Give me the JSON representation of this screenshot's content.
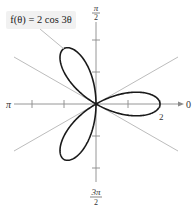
{
  "chart_data": {
    "type": "line",
    "subtype": "polar-rose",
    "title": "",
    "equation": "f(θ) = 2 cos 3θ",
    "function": {
      "amplitude": 2,
      "frequency": 3,
      "form": "cos"
    },
    "series": [
      {
        "name": "f(θ) = 2 cos 3θ",
        "petals": 3,
        "petal_angles_deg": [
          0,
          120,
          240
        ],
        "max_r": 2,
        "color": "#1a1a1a"
      }
    ],
    "axes": {
      "angle_labels": [
        {
          "angle": "0",
          "position": "right"
        },
        {
          "angle": "π/2",
          "position": "top"
        },
        {
          "angle": "π",
          "position": "left"
        },
        {
          "angle": "3π/2",
          "position": "bottom"
        }
      ],
      "radial_tick_labels": [
        {
          "value": "2",
          "position": "on polar axis at θ=0"
        }
      ],
      "radial_ticks": [
        1,
        2
      ],
      "r_range": [
        0,
        2.5
      ],
      "reference_lines_deg": [
        30,
        150
      ],
      "grid": false
    },
    "legend": null
  },
  "labels": {
    "equation_left": "f(θ) = 2 cos 3θ",
    "zero": "0",
    "pi": "π",
    "pi_half_num": "π",
    "pi_half_den": "2",
    "three_pi_half_num": "3π",
    "three_pi_half_den": "2",
    "r_two": "2"
  },
  "colors": {
    "curve": "#1a1a1a",
    "axis": "#8a8a8a",
    "reference_line": "#b4b4b4",
    "callout_bg": "#f1f1f1",
    "leader": "#b4b4b4"
  }
}
